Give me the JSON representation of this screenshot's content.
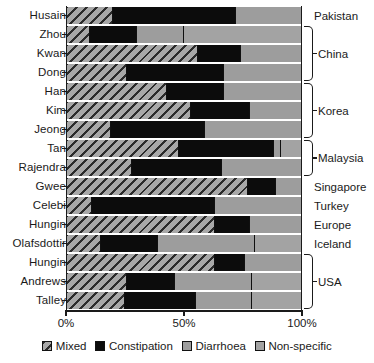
{
  "chart_data": {
    "type": "bar",
    "orientation": "horizontal",
    "stacked": true,
    "title": "",
    "xlabel": "",
    "ylabel": "",
    "xlim": [
      0,
      100
    ],
    "xtick_labels": [
      "0%",
      "50%",
      "100%"
    ],
    "xtick_values": [
      0,
      50,
      100
    ],
    "grid": false,
    "legend_position": "bottom",
    "categories": [
      "Husain",
      "Zhou",
      "Kwan",
      "Dong",
      "Han",
      "Kim",
      "Jeong",
      "Tan",
      "Rajendra",
      "Gwee",
      "Celebi",
      "Hungin",
      "Olafsdottir",
      "Hungin",
      "Andrews",
      "Talley"
    ],
    "series": [
      {
        "name": "Mixed",
        "color": "#9a9a9a",
        "pattern": "diagonal-hatch",
        "values": [
          20,
          10,
          56,
          26,
          43,
          53,
          19,
          48,
          28,
          77,
          11,
          63,
          15,
          63,
          26,
          25
        ]
      },
      {
        "name": "Constipation",
        "color": "#0c0c0c",
        "pattern": "solid",
        "values": [
          52,
          20,
          18,
          41,
          24,
          25,
          40,
          40,
          38,
          12,
          52,
          15,
          24,
          13,
          20,
          30
        ]
      },
      {
        "name": "Diarrhoea",
        "color": "#9d9d9d",
        "pattern": "solid",
        "values": [
          28,
          20,
          26,
          33,
          33,
          22,
          41,
          3,
          34,
          11,
          37,
          22,
          41,
          24,
          33,
          24
        ]
      },
      {
        "name": "Non-specific",
        "color": "#a3a3a3",
        "pattern": "solid",
        "values": [
          0,
          50,
          0,
          0,
          0,
          0,
          0,
          9,
          0,
          0,
          0,
          0,
          20,
          0,
          21,
          21
        ]
      }
    ]
  },
  "rows": [
    {
      "study": "Husain",
      "mixed": 20,
      "constipation": 52,
      "diarrhoea": 28,
      "nonspecific": 0
    },
    {
      "study": "Zhou",
      "mixed": 10,
      "constipation": 20,
      "diarrhoea": 20,
      "nonspecific": 50
    },
    {
      "study": "Kwan",
      "mixed": 56,
      "constipation": 18,
      "diarrhoea": 26,
      "nonspecific": 0
    },
    {
      "study": "Dong",
      "mixed": 26,
      "constipation": 41,
      "diarrhoea": 33,
      "nonspecific": 0
    },
    {
      "study": "Han",
      "mixed": 43,
      "constipation": 24,
      "diarrhoea": 33,
      "nonspecific": 0
    },
    {
      "study": "Kim",
      "mixed": 53,
      "constipation": 25,
      "diarrhoea": 22,
      "nonspecific": 0
    },
    {
      "study": "Jeong",
      "mixed": 19,
      "constipation": 40,
      "diarrhoea": 41,
      "nonspecific": 0
    },
    {
      "study": "Tan",
      "mixed": 48,
      "constipation": 40,
      "diarrhoea": 3,
      "nonspecific": 9
    },
    {
      "study": "Rajendra",
      "mixed": 28,
      "constipation": 38,
      "diarrhoea": 34,
      "nonspecific": 0
    },
    {
      "study": "Gwee",
      "mixed": 77,
      "constipation": 12,
      "diarrhoea": 11,
      "nonspecific": 0
    },
    {
      "study": "Celebi",
      "mixed": 11,
      "constipation": 52,
      "diarrhoea": 37,
      "nonspecific": 0
    },
    {
      "study": "Hungin",
      "mixed": 63,
      "constipation": 15,
      "diarrhoea": 22,
      "nonspecific": 0
    },
    {
      "study": "Olafsdottir",
      "mixed": 15,
      "constipation": 24,
      "diarrhoea": 41,
      "nonspecific": 20
    },
    {
      "study": "Hungin",
      "mixed": 63,
      "constipation": 13,
      "diarrhoea": 24,
      "nonspecific": 0
    },
    {
      "study": "Andrews",
      "mixed": 26,
      "constipation": 20,
      "diarrhoea": 33,
      "nonspecific": 21
    },
    {
      "study": "Talley",
      "mixed": 25,
      "constipation": 30,
      "diarrhoea": 24,
      "nonspecific": 21
    }
  ],
  "countries": [
    {
      "label": "Pakistan",
      "start_row": 0,
      "span": 1
    },
    {
      "label": "China",
      "start_row": 1,
      "span": 3
    },
    {
      "label": "Korea",
      "start_row": 4,
      "span": 3
    },
    {
      "label": "Malaysia",
      "start_row": 7,
      "span": 2
    },
    {
      "label": "Singapore",
      "start_row": 9,
      "span": 1
    },
    {
      "label": "Turkey",
      "start_row": 10,
      "span": 1
    },
    {
      "label": "Europe",
      "start_row": 11,
      "span": 1
    },
    {
      "label": "Iceland",
      "start_row": 12,
      "span": 1
    },
    {
      "label": "USA",
      "start_row": 13,
      "span": 3
    }
  ],
  "legend": {
    "items": [
      {
        "label": "Mixed",
        "key": "mixed"
      },
      {
        "label": "Constipation",
        "key": "constipation"
      },
      {
        "label": "Diarrhoea",
        "key": "diarrhoea"
      },
      {
        "label": "Non-specific",
        "key": "nonspecific"
      }
    ]
  },
  "axis": {
    "ticks": [
      {
        "label": "0%",
        "value": 0
      },
      {
        "label": "50%",
        "value": 50
      },
      {
        "label": "100%",
        "value": 100
      }
    ]
  }
}
